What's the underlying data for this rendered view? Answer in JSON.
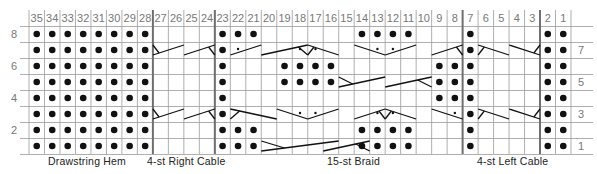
{
  "chart_data": {
    "type": "knitting-chart",
    "columns": [
      35,
      34,
      33,
      32,
      31,
      30,
      29,
      28,
      27,
      26,
      25,
      24,
      23,
      22,
      21,
      20,
      19,
      18,
      17,
      16,
      15,
      14,
      13,
      12,
      11,
      10,
      9,
      8,
      7,
      6,
      5,
      4,
      3,
      2,
      1
    ],
    "rows_top_to_bottom": [
      8,
      7,
      6,
      5,
      4,
      3,
      2,
      1
    ],
    "left_row_labels": [
      {
        "row": 8,
        "label": "8"
      },
      {
        "row": 6,
        "label": "6"
      },
      {
        "row": 4,
        "label": "4"
      },
      {
        "row": 2,
        "label": "2"
      }
    ],
    "right_row_labels": [
      {
        "row": 7,
        "label": "7"
      },
      {
        "row": 5,
        "label": "5"
      },
      {
        "row": 3,
        "label": "3"
      },
      {
        "row": 1,
        "label": "1"
      }
    ],
    "section_dividers_after_columns": [
      28,
      24,
      8,
      3
    ],
    "purl_cells": {
      "8": [
        35,
        34,
        33,
        32,
        31,
        30,
        29,
        28,
        23,
        22,
        21,
        14,
        13,
        12,
        11,
        7,
        2,
        1
      ],
      "7": [
        35,
        34,
        33,
        32,
        31,
        30,
        29,
        28,
        23,
        7,
        2,
        1
      ],
      "6": [
        35,
        34,
        33,
        32,
        31,
        30,
        29,
        28,
        23,
        19,
        18,
        17,
        16,
        9,
        8,
        7,
        2,
        1
      ],
      "5": [
        35,
        34,
        33,
        32,
        31,
        30,
        29,
        28,
        23,
        19,
        18,
        17,
        16,
        9,
        8,
        7,
        2,
        1
      ],
      "4": [
        35,
        34,
        33,
        32,
        31,
        30,
        29,
        28,
        23,
        9,
        8,
        7,
        2,
        1
      ],
      "3": [
        35,
        34,
        33,
        32,
        31,
        30,
        29,
        28,
        23,
        7,
        2,
        1
      ],
      "2": [
        35,
        34,
        33,
        32,
        31,
        30,
        29,
        28,
        23,
        22,
        21,
        14,
        13,
        12,
        11,
        7,
        2,
        1
      ],
      "1": [
        35,
        34,
        33,
        32,
        31,
        30,
        29,
        28,
        23,
        22,
        21,
        14,
        13,
        12,
        11,
        7,
        2,
        1
      ]
    },
    "small_dot_cells": {
      "7": [
        22,
        18,
        17,
        13,
        12
      ],
      "3": [
        18,
        17,
        13,
        12,
        8
      ]
    },
    "cable_symbols": [
      {
        "row": 7,
        "from_col": 27,
        "to_col": 26,
        "type": "rising",
        "leg": "left"
      },
      {
        "row": 7,
        "from_col": 25,
        "to_col": 24,
        "type": "rising",
        "leg": "right"
      },
      {
        "row": 7,
        "from_col": 22,
        "to_col": 21,
        "type": "rising",
        "leg": "none"
      },
      {
        "row": 7,
        "from_col": 20,
        "to_col": 18,
        "type": "rising",
        "leg": "right"
      },
      {
        "row": 7,
        "from_col": 17,
        "to_col": 16,
        "type": "falling",
        "leg": "left"
      },
      {
        "row": 7,
        "from_col": 14,
        "to_col": 13,
        "type": "falling",
        "leg": "none"
      },
      {
        "row": 7,
        "from_col": 12,
        "to_col": 11,
        "type": "rising",
        "leg": "none"
      },
      {
        "row": 7,
        "from_col": 9,
        "to_col": 8,
        "type": "rising",
        "leg": "right"
      },
      {
        "row": 7,
        "from_col": 6,
        "to_col": 5,
        "type": "falling",
        "leg": "left"
      },
      {
        "row": 7,
        "from_col": 4,
        "to_col": 3,
        "type": "falling",
        "leg": "right"
      },
      {
        "row": 5,
        "from_col": 15,
        "to_col": 13,
        "type": "crossing",
        "leg": "left"
      },
      {
        "row": 5,
        "from_col": 12,
        "to_col": 10,
        "type": "crossing",
        "leg": "right"
      },
      {
        "row": 3,
        "from_col": 27,
        "to_col": 26,
        "type": "rising",
        "leg": "left"
      },
      {
        "row": 3,
        "from_col": 25,
        "to_col": 24,
        "type": "rising",
        "leg": "right"
      },
      {
        "row": 3,
        "from_col": 22,
        "to_col": 20,
        "type": "falling",
        "leg": "left"
      },
      {
        "row": 3,
        "from_col": 19,
        "to_col": 18,
        "type": "falling",
        "leg": "none"
      },
      {
        "row": 3,
        "from_col": 17,
        "to_col": 16,
        "type": "rising",
        "leg": "none"
      },
      {
        "row": 3,
        "from_col": 14,
        "to_col": 13,
        "type": "rising",
        "leg": "right"
      },
      {
        "row": 3,
        "from_col": 12,
        "to_col": 11,
        "type": "falling",
        "leg": "left"
      },
      {
        "row": 3,
        "from_col": 9,
        "to_col": 8,
        "type": "falling",
        "leg": "none"
      },
      {
        "row": 3,
        "from_col": 6,
        "to_col": 5,
        "type": "falling",
        "leg": "left"
      },
      {
        "row": 3,
        "from_col": 4,
        "to_col": 3,
        "type": "falling",
        "leg": "right"
      },
      {
        "row": 1,
        "from_col": 20,
        "to_col": 16,
        "type": "crossing",
        "leg": "left"
      },
      {
        "row": 1,
        "from_col": 16,
        "to_col": 14,
        "type": "crossing",
        "leg": "right"
      }
    ],
    "section_labels": [
      {
        "label": "Drawstring Hem",
        "columns": [
          35,
          28
        ]
      },
      {
        "label": "4-st Right Cable",
        "columns": [
          27,
          24
        ]
      },
      {
        "label": "15-st Braid",
        "columns": [
          22,
          8
        ]
      },
      {
        "label": "4-st Left Cable",
        "columns": [
          6,
          3
        ]
      }
    ],
    "colors": {
      "grid": "#9a9a9a",
      "divider": "#6f6f6f",
      "ink": "#111111",
      "label": "#777777"
    }
  },
  "captions": {
    "hem": "Drawstring Hem",
    "right_cable": "4-st Right Cable",
    "braid": "15-st Braid",
    "left_cable": "4-st Left Cable"
  }
}
